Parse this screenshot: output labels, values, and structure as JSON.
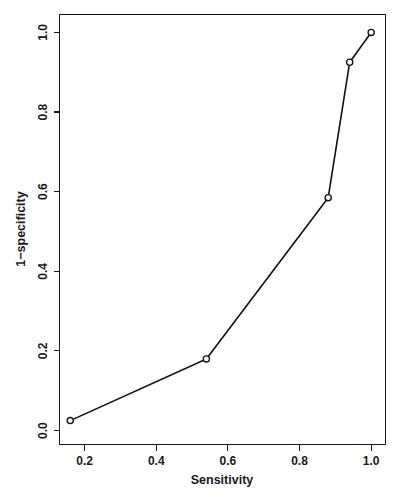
{
  "chart_data": {
    "type": "line",
    "title": "",
    "subtitle": "",
    "xlabel": "Sensitivity",
    "ylabel": "1−specificity",
    "xlim": [
      0.13,
      1.04
    ],
    "ylim": [
      -0.035,
      1.045
    ],
    "grid": false,
    "legend": null,
    "marker": "open-circle",
    "x": [
      0.16,
      0.54,
      0.88,
      0.94,
      1.0
    ],
    "y": [
      0.025,
      0.18,
      0.585,
      0.925,
      1.0
    ],
    "points": [
      {
        "x": 0.16,
        "y": 0.025
      },
      {
        "x": 0.54,
        "y": 0.18
      },
      {
        "x": 0.88,
        "y": 0.585
      },
      {
        "x": 0.94,
        "y": 0.925
      },
      {
        "x": 1.0,
        "y": 1.0
      }
    ],
    "xticks": [
      0.2,
      0.4,
      0.6,
      0.8,
      1.0
    ],
    "xtick_labels": [
      "0.2",
      "0.4",
      "0.6",
      "0.8",
      "1.0"
    ],
    "yticks": [
      0.0,
      0.2,
      0.4,
      0.6,
      0.8,
      1.0
    ],
    "ytick_labels": [
      "0.0",
      "0.2",
      "0.4",
      "0.6",
      "0.8",
      "1.0"
    ],
    "line_color": "#111111",
    "marker_color": "#111111",
    "background_color": "#ffffff",
    "axis_color": "#1a1a1a"
  }
}
